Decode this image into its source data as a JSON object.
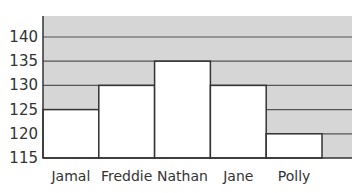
{
  "chart_data": {
    "type": "bar",
    "title": "",
    "xlabel": "",
    "ylabel": "",
    "categories": [
      "Jamal",
      "Freddie",
      "Nathan",
      "Jane",
      "Polly"
    ],
    "values": [
      125,
      130,
      135,
      130,
      120
    ],
    "ylim": [
      115,
      144
    ],
    "yticks": [
      115,
      120,
      125,
      130,
      135,
      140
    ],
    "ytick_labels": [
      "115",
      "120",
      "125",
      "130",
      "135",
      "140"
    ],
    "grid": true,
    "legend": null
  },
  "colors": {
    "plot_background": "#d6d6d6",
    "bar_fill": "#ffffff",
    "bar_stroke": "#333333",
    "gridline": "#555555",
    "axis": "#333333",
    "text": "#333333"
  }
}
